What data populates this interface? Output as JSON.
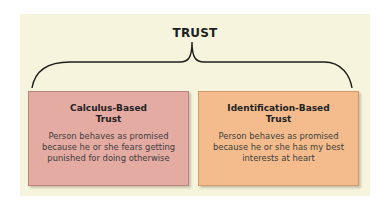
{
  "diagram": {
    "title": "TRUST",
    "colors": {
      "background_panel": "#f6f4dc",
      "calculus_box": "#e4aba3",
      "identification_box": "#f4bc8c",
      "brace": "#1e1e1e"
    },
    "boxes": [
      {
        "title_lines": [
          "Calculus-Based",
          "Trust"
        ],
        "description_lines": [
          "Person behaves as promised",
          "because he or she fears getting",
          "punished for doing otherwise"
        ]
      },
      {
        "title_lines": [
          "Identification-Based",
          "Trust"
        ],
        "description_lines": [
          "Person behaves as promised",
          "because he or she has my best",
          "interests at heart"
        ]
      }
    ]
  }
}
